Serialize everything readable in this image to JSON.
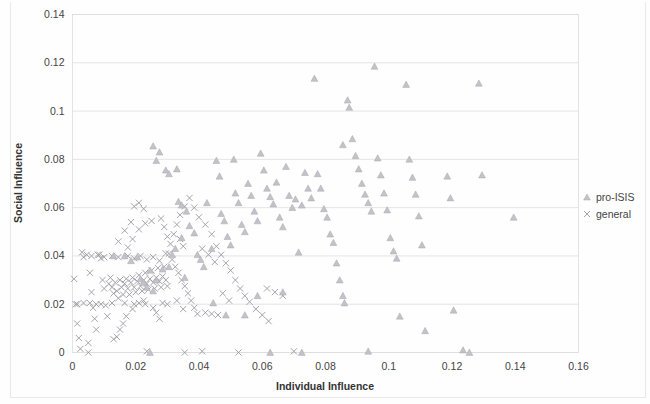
{
  "chart_data": {
    "type": "scatter",
    "title": "",
    "xlabel": "Individual Influence",
    "ylabel": "Social Influence",
    "xlim": [
      0,
      0.16
    ],
    "ylim": [
      0,
      0.14
    ],
    "xticks": [
      "0",
      "0.02",
      "0.04",
      "0.06",
      "0.08",
      "0.1",
      "0.12",
      "0.14",
      "0.16"
    ],
    "xtick_values": [
      0,
      0.02,
      0.04,
      0.06,
      0.08,
      0.1,
      0.12,
      0.14,
      0.16
    ],
    "yticks": [
      "0",
      "0.02",
      "0.04",
      "0.06",
      "0.08",
      "0.1",
      "0.12",
      "0.14"
    ],
    "ytick_values": [
      0,
      0.02,
      0.04,
      0.06,
      0.08,
      0.1,
      0.12,
      0.14
    ],
    "grid": "horizontal",
    "legend_position": "right",
    "series": [
      {
        "name": "pro-ISIS",
        "marker": "triangle",
        "color": "#c2c2c8",
        "points": [
          [
            0.0255,
            0.0855
          ],
          [
            0.0265,
            0.0795
          ],
          [
            0.0275,
            0.083
          ],
          [
            0.0295,
            0.0755
          ],
          [
            0.0305,
            0.074
          ],
          [
            0.033,
            0.076
          ],
          [
            0.0335,
            0.0625
          ],
          [
            0.0345,
            0.061
          ],
          [
            0.036,
            0.0585
          ],
          [
            0.037,
            0.0525
          ],
          [
            0.0385,
            0.0495
          ],
          [
            0.0395,
            0.0405
          ],
          [
            0.0405,
            0.0385
          ],
          [
            0.0415,
            0.0355
          ],
          [
            0.0425,
            0.062
          ],
          [
            0.044,
            0.043
          ],
          [
            0.0455,
            0.0795
          ],
          [
            0.0465,
            0.073
          ],
          [
            0.047,
            0.0575
          ],
          [
            0.048,
            0.0545
          ],
          [
            0.049,
            0.048
          ],
          [
            0.05,
            0.0445
          ],
          [
            0.051,
            0.08
          ],
          [
            0.0515,
            0.066
          ],
          [
            0.0525,
            0.062
          ],
          [
            0.0535,
            0.053
          ],
          [
            0.0545,
            0.05
          ],
          [
            0.0555,
            0.07
          ],
          [
            0.0565,
            0.065
          ],
          [
            0.0575,
            0.0585
          ],
          [
            0.0585,
            0.0545
          ],
          [
            0.0595,
            0.0825
          ],
          [
            0.0605,
            0.0755
          ],
          [
            0.0615,
            0.068
          ],
          [
            0.0625,
            0.0645
          ],
          [
            0.0635,
            0.0615
          ],
          [
            0.0645,
            0.0705
          ],
          [
            0.0655,
            0.056
          ],
          [
            0.0665,
            0.052
          ],
          [
            0.0675,
            0.077
          ],
          [
            0.0685,
            0.065
          ],
          [
            0.0695,
            0.06
          ],
          [
            0.0705,
            0.0635
          ],
          [
            0.0715,
            0.0415
          ],
          [
            0.0725,
            0.061
          ],
          [
            0.0735,
            0.0745
          ],
          [
            0.0745,
            0.068
          ],
          [
            0.0755,
            0.064
          ],
          [
            0.0765,
            0.1135
          ],
          [
            0.0775,
            0.074
          ],
          [
            0.0785,
            0.068
          ],
          [
            0.0795,
            0.0595
          ],
          [
            0.0805,
            0.056
          ],
          [
            0.0815,
            0.049
          ],
          [
            0.0825,
            0.0455
          ],
          [
            0.0835,
            0.037
          ],
          [
            0.0845,
            0.03
          ],
          [
            0.0855,
            0.0235
          ],
          [
            0.086,
            0.0205
          ],
          [
            0.087,
            0.1045
          ],
          [
            0.0875,
            0.1015
          ],
          [
            0.0885,
            0.0885
          ],
          [
            0.0895,
            0.0815
          ],
          [
            0.0905,
            0.076
          ],
          [
            0.0915,
            0.07
          ],
          [
            0.0925,
            0.0655
          ],
          [
            0.0935,
            0.062
          ],
          [
            0.0945,
            0.0585
          ],
          [
            0.0955,
            0.1185
          ],
          [
            0.0965,
            0.0805
          ],
          [
            0.0975,
            0.0735
          ],
          [
            0.0985,
            0.066
          ],
          [
            0.0995,
            0.059
          ],
          [
            0.1005,
            0.0475
          ],
          [
            0.1015,
            0.042
          ],
          [
            0.1025,
            0.039
          ],
          [
            0.1035,
            0.015
          ],
          [
            0.1055,
            0.111
          ],
          [
            0.1065,
            0.08
          ],
          [
            0.1075,
            0.0725
          ],
          [
            0.1085,
            0.0655
          ],
          [
            0.1095,
            0.0565
          ],
          [
            0.1105,
            0.0445
          ],
          [
            0.1115,
            0.009
          ],
          [
            0.1185,
            0.073
          ],
          [
            0.1195,
            0.064
          ],
          [
            0.1205,
            0.0175
          ],
          [
            0.1255,
            0.0
          ],
          [
            0.1285,
            0.1115
          ],
          [
            0.1295,
            0.0735
          ],
          [
            0.1395,
            0.056
          ],
          [
            0.0245,
            0.0
          ],
          [
            0.0625,
            0.0
          ],
          [
            0.0725,
            0.0
          ],
          [
            0.0935,
            0.0005
          ],
          [
            0.1235,
            0.001
          ],
          [
            0.0215,
            0.0305
          ],
          [
            0.0225,
            0.029
          ],
          [
            0.0235,
            0.027
          ],
          [
            0.0245,
            0.034
          ],
          [
            0.0255,
            0.0255
          ],
          [
            0.0265,
            0.03
          ],
          [
            0.0285,
            0.0345
          ],
          [
            0.0305,
            0.0355
          ],
          [
            0.0315,
            0.0405
          ],
          [
            0.0325,
            0.043
          ],
          [
            0.0345,
            0.0475
          ],
          [
            0.0355,
            0.031
          ],
          [
            0.0185,
            0.038
          ],
          [
            0.0165,
            0.04
          ],
          [
            0.013,
            0.04
          ],
          [
            0.0205,
            0.0395
          ],
          [
            0.0445,
            0.0205
          ],
          [
            0.0485,
            0.0155
          ],
          [
            0.0545,
            0.0155
          ],
          [
            0.0585,
            0.0235
          ],
          [
            0.0665,
            0.025
          ],
          [
            0.0855,
            0.086
          ]
        ]
      },
      {
        "name": "general",
        "marker": "x",
        "color": "#9a9aa2",
        "points": [
          [
            0.0005,
            0.0305
          ],
          [
            0.001,
            0.02
          ],
          [
            0.0015,
            0.012
          ],
          [
            0.002,
            0.006
          ],
          [
            0.0025,
            0.0015
          ],
          [
            0.003,
            0.0415
          ],
          [
            0.0035,
            0.0395
          ],
          [
            0.0045,
            0.0405
          ],
          [
            0.0055,
            0.033
          ],
          [
            0.006,
            0.025
          ],
          [
            0.0065,
            0.0185
          ],
          [
            0.007,
            0.014
          ],
          [
            0.0075,
            0.0095
          ],
          [
            0.0085,
            0.0405
          ],
          [
            0.009,
            0.039
          ],
          [
            0.0095,
            0.03
          ],
          [
            0.01,
            0.0265
          ],
          [
            0.0105,
            0.0195
          ],
          [
            0.011,
            0.015
          ],
          [
            0.0115,
            0.0285
          ],
          [
            0.012,
            0.031
          ],
          [
            0.0125,
            0.027
          ],
          [
            0.013,
            0.0245
          ],
          [
            0.0135,
            0.029
          ],
          [
            0.014,
            0.0255
          ],
          [
            0.0145,
            0.0225
          ],
          [
            0.015,
            0.03
          ],
          [
            0.0155,
            0.027
          ],
          [
            0.016,
            0.024
          ],
          [
            0.0165,
            0.0285
          ],
          [
            0.017,
            0.0305
          ],
          [
            0.0175,
            0.0265
          ],
          [
            0.018,
            0.024
          ],
          [
            0.0185,
            0.029
          ],
          [
            0.019,
            0.031
          ],
          [
            0.0195,
            0.027
          ],
          [
            0.02,
            0.025
          ],
          [
            0.0205,
            0.0295
          ],
          [
            0.021,
            0.032
          ],
          [
            0.0215,
            0.0275
          ],
          [
            0.022,
            0.0255
          ],
          [
            0.0225,
            0.03
          ],
          [
            0.023,
            0.033
          ],
          [
            0.0235,
            0.0285
          ],
          [
            0.024,
            0.026
          ],
          [
            0.0245,
            0.0305
          ],
          [
            0.025,
            0.034
          ],
          [
            0.0255,
            0.029
          ],
          [
            0.026,
            0.0265
          ],
          [
            0.0265,
            0.031
          ],
          [
            0.027,
            0.035
          ],
          [
            0.0275,
            0.0295
          ],
          [
            0.028,
            0.027
          ],
          [
            0.0285,
            0.0315
          ],
          [
            0.029,
            0.0355
          ],
          [
            0.0295,
            0.03
          ],
          [
            0.03,
            0.0275
          ],
          [
            0.0125,
            0.04
          ],
          [
            0.0145,
            0.0395
          ],
          [
            0.0175,
            0.04
          ],
          [
            0.0195,
            0.039
          ],
          [
            0.0215,
            0.04
          ],
          [
            0.0235,
            0.0385
          ],
          [
            0.0255,
            0.0395
          ],
          [
            0.0275,
            0.038
          ],
          [
            0.0295,
            0.041
          ],
          [
            0.006,
            0.04
          ],
          [
            0.008,
            0.0405
          ],
          [
            0.01,
            0.0395
          ],
          [
            0.031,
            0.045
          ],
          [
            0.032,
            0.049
          ],
          [
            0.033,
            0.053
          ],
          [
            0.034,
            0.047
          ],
          [
            0.035,
            0.044
          ],
          [
            0.0305,
            0.041
          ],
          [
            0.0315,
            0.0385
          ],
          [
            0.0325,
            0.0355
          ],
          [
            0.0335,
            0.033
          ],
          [
            0.0345,
            0.03
          ],
          [
            0.0355,
            0.0275
          ],
          [
            0.0365,
            0.0245
          ],
          [
            0.0375,
            0.0215
          ],
          [
            0.0385,
            0.0185
          ],
          [
            0.0395,
            0.016
          ],
          [
            0.0255,
            0.0185
          ],
          [
            0.0265,
            0.0165
          ],
          [
            0.0275,
            0.014
          ],
          [
            0.023,
            0.02
          ],
          [
            0.021,
            0.0205
          ],
          [
            0.019,
            0.018
          ],
          [
            0.017,
            0.015
          ],
          [
            0.016,
            0.012
          ],
          [
            0.015,
            0.0095
          ],
          [
            0.014,
            0.0065
          ],
          [
            0.013,
            0.0055
          ],
          [
            0.009,
            0.02
          ],
          [
            0.0075,
            0.02
          ],
          [
            0.0055,
            0.0205
          ],
          [
            0.0035,
            0.0205
          ],
          [
            0.0015,
            0.02
          ],
          [
            0.0285,
            0.0205
          ],
          [
            0.03,
            0.02
          ],
          [
            0.033,
            0.0215
          ],
          [
            0.035,
            0.018
          ],
          [
            0.0125,
            0.0205
          ],
          [
            0.0165,
            0.0205
          ],
          [
            0.0195,
            0.02
          ],
          [
            0.0225,
            0.0215
          ],
          [
            0.005,
            0.0
          ],
          [
            0.0235,
            0.0005
          ],
          [
            0.005,
            0.004
          ],
          [
            0.042,
            0.0165
          ],
          [
            0.044,
            0.016
          ],
          [
            0.046,
            0.0155
          ],
          [
            0.03,
            0.048
          ],
          [
            0.029,
            0.052
          ],
          [
            0.028,
            0.0555
          ],
          [
            0.025,
            0.0545
          ],
          [
            0.023,
            0.0535
          ],
          [
            0.021,
            0.051
          ],
          [
            0.019,
            0.047
          ],
          [
            0.0175,
            0.0435
          ],
          [
            0.034,
            0.057
          ],
          [
            0.0355,
            0.0605
          ],
          [
            0.037,
            0.064
          ],
          [
            0.0385,
            0.06
          ],
          [
            0.04,
            0.056
          ],
          [
            0.042,
            0.053
          ],
          [
            0.044,
            0.049
          ],
          [
            0.0455,
            0.044
          ],
          [
            0.047,
            0.0405
          ],
          [
            0.0485,
            0.037
          ],
          [
            0.05,
            0.034
          ],
          [
            0.0515,
            0.03
          ],
          [
            0.053,
            0.0265
          ],
          [
            0.0545,
            0.0235
          ],
          [
            0.056,
            0.021
          ],
          [
            0.058,
            0.018
          ],
          [
            0.06,
            0.0155
          ],
          [
            0.062,
            0.013
          ],
          [
            0.0195,
            0.0605
          ],
          [
            0.021,
            0.062
          ],
          [
            0.0225,
            0.0595
          ],
          [
            0.0185,
            0.054
          ],
          [
            0.0165,
            0.0505
          ],
          [
            0.0145,
            0.046
          ],
          [
            0.041,
            0.043
          ],
          [
            0.043,
            0.0405
          ],
          [
            0.045,
            0.0375
          ],
          [
            0.0615,
            0.0265
          ],
          [
            0.064,
            0.025
          ],
          [
            0.0665,
            0.0235
          ],
          [
            0.07,
            0.0005
          ],
          [
            0.0525,
            0.0
          ],
          [
            0.0355,
            0.0
          ],
          [
            0.041,
            0.0005
          ],
          [
            0.0475,
            0.0245
          ],
          [
            0.0495,
            0.0215
          ]
        ]
      }
    ]
  },
  "legend": {
    "items": [
      {
        "label": "pro-ISIS",
        "marker": "triangle"
      },
      {
        "label": "general",
        "marker": "x"
      }
    ]
  }
}
